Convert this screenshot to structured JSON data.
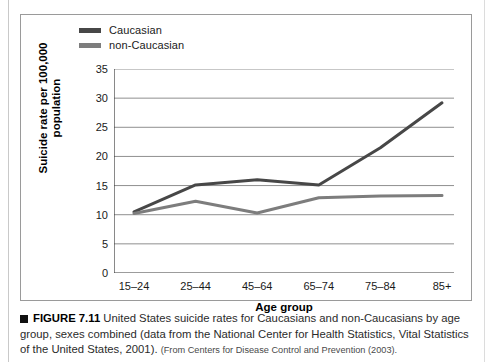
{
  "figure": {
    "legend": [
      {
        "label": "Caucasian",
        "color": "#474747"
      },
      {
        "label": "non-Caucasian",
        "color": "#7d7d7d"
      }
    ],
    "xaxis_title": "Age group",
    "yaxis_title": "Suicide rate per 100,000 population"
  },
  "caption": {
    "figure_number": "FIGURE 7.11",
    "text": "United States suicide rates for Caucasians and non-Caucasians by age group, sexes combined (data from the National Center for Health Statistics, Vital Statistics of the United States, 2001).",
    "source": "(From Centers for Disease Control and Prevention (2003)."
  },
  "chart_data": {
    "type": "line",
    "title": "",
    "xlabel": "Age group",
    "ylabel": "Suicide rate per 100,000 population",
    "categories": [
      "15–24",
      "25–44",
      "45–64",
      "65–74",
      "75–84",
      "85+"
    ],
    "ylim": [
      0,
      35
    ],
    "yticks": [
      0,
      5,
      10,
      15,
      20,
      25,
      30,
      35
    ],
    "grid": true,
    "legend_position": "top-left",
    "series": [
      {
        "name": "Caucasian",
        "color": "#474747",
        "values": [
          10.5,
          15.1,
          16.0,
          15.1,
          21.5,
          29.2
        ]
      },
      {
        "name": "non-Caucasian",
        "color": "#7d7d7d",
        "values": [
          10.2,
          12.3,
          10.3,
          12.9,
          13.2,
          13.3
        ]
      }
    ]
  }
}
